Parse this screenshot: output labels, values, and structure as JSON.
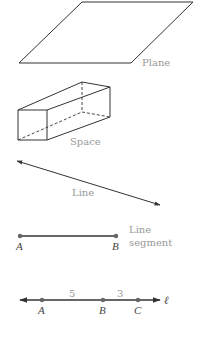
{
  "figures": {
    "plane": {
      "label": "Plane",
      "vertices": [
        [
          19,
          63
        ],
        [
          82,
          2
        ],
        [
          193,
          2
        ],
        [
          131,
          63
        ]
      ]
    },
    "space": {
      "label": "Space"
    },
    "line": {
      "label": "Line",
      "from": [
        17,
        161
      ],
      "to": [
        160,
        205
      ]
    },
    "segment": {
      "label_line1": "Line",
      "label_line2": "segment",
      "points": [
        {
          "name": "A",
          "x": 20
        },
        {
          "name": "B",
          "x": 116
        }
      ]
    },
    "number_line": {
      "name": "ℓ",
      "points": [
        {
          "name": "A",
          "x": 42
        },
        {
          "name": "B",
          "x": 103
        },
        {
          "name": "C",
          "x": 138
        }
      ],
      "distances": [
        {
          "value": "5",
          "between": "A-B"
        },
        {
          "value": "3",
          "between": "B-C"
        }
      ]
    }
  },
  "colors": {
    "line": "#333333",
    "label": "#9a9a9a",
    "point": "#666666"
  }
}
